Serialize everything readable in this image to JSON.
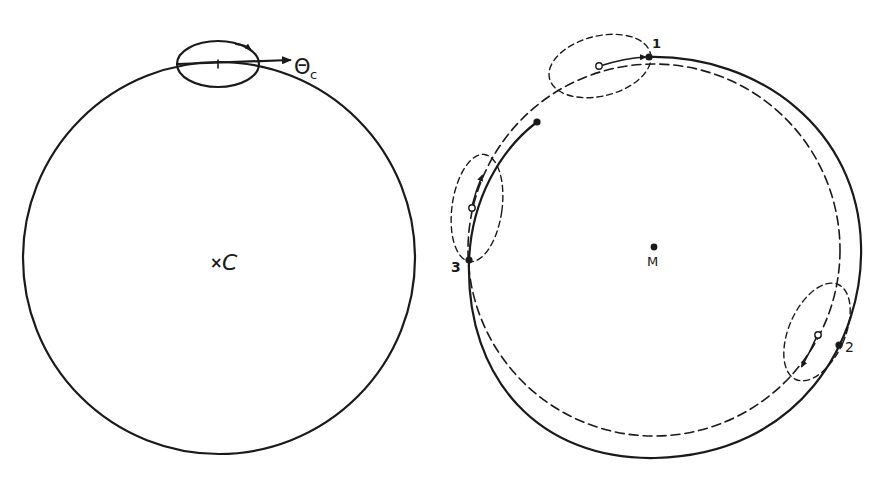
{
  "figure": {
    "left_panel": {
      "center_label": "C",
      "center_marker": "×",
      "vector_label": "Θ",
      "vector_subscript": "c"
    },
    "right_panel": {
      "center_label": "M",
      "points": [
        {
          "id": "1",
          "label": "1"
        },
        {
          "id": "2",
          "label": "2"
        },
        {
          "id": "3",
          "label": "3"
        }
      ]
    },
    "colors": {
      "ink": "#1a1a1a",
      "background": "#ffffff"
    }
  }
}
